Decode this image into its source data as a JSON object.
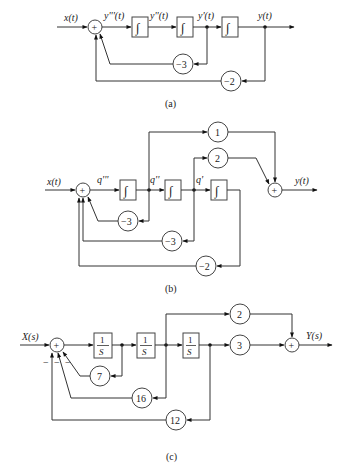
{
  "diagrams": [
    {
      "id": "a",
      "caption": "(a)",
      "input_label": "x(t)",
      "output_label": "y(t)",
      "signals": [
        "y'''(t)",
        "y''(t)",
        "y'(t)"
      ],
      "integrator_symbol": "∫",
      "summer_symbol": "+",
      "feedback_gains": [
        "−3",
        "−2"
      ]
    },
    {
      "id": "b",
      "caption": "(b)",
      "input_label": "x(t)",
      "output_label": "y(t)",
      "signals": [
        "q'''",
        "q''",
        "q'"
      ],
      "integrator_symbol": "∫",
      "summer_symbol": "+",
      "feedforward_gains": [
        "1",
        "2"
      ],
      "feedback_gains": [
        "−3",
        "−3",
        "−2"
      ]
    },
    {
      "id": "c",
      "caption": "(c)",
      "input_label": "X(s)",
      "output_label": "Y(s)",
      "block_numerator": "1",
      "block_denominator": "S",
      "summer_symbol": "+",
      "feedforward_gains": [
        "2",
        "3"
      ],
      "feedback_gains": [
        "7",
        "16",
        "12"
      ],
      "feedback_signs": [
        "−",
        "−",
        "−"
      ]
    }
  ]
}
